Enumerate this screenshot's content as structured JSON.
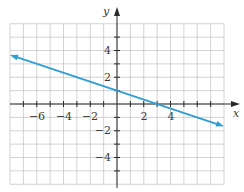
{
  "chart_data": {
    "type": "line",
    "title": "",
    "xlabel": "x",
    "ylabel": "y",
    "xlim": [
      -8,
      8
    ],
    "ylim": [
      -6,
      6
    ],
    "grid": true,
    "grid_step": 1,
    "x_tick_labels": [
      -6,
      -4,
      -2,
      2,
      4
    ],
    "y_tick_labels": [
      4,
      2,
      -2,
      -4
    ],
    "series": [
      {
        "name": "line",
        "equation": "y = -x/3 + 1",
        "slope": -0.3333,
        "intercept": 1,
        "x": [
          -8,
          0,
          3,
          8
        ],
        "y": [
          3.67,
          1,
          0,
          -1.67
        ],
        "arrows_both_ends": true,
        "color": "#2e9fd4"
      }
    ],
    "legend": "none"
  },
  "colors": {
    "grid": "#c8c8c8",
    "axis": "#2a2a2a",
    "line": "#2e9fd4"
  },
  "labels": {
    "x_axis": "x",
    "y_axis": "y",
    "x_ticks": [
      "−6",
      "−4",
      "−2",
      "2",
      "4"
    ],
    "y_ticks": [
      "4",
      "2",
      "−2",
      "−4"
    ]
  }
}
